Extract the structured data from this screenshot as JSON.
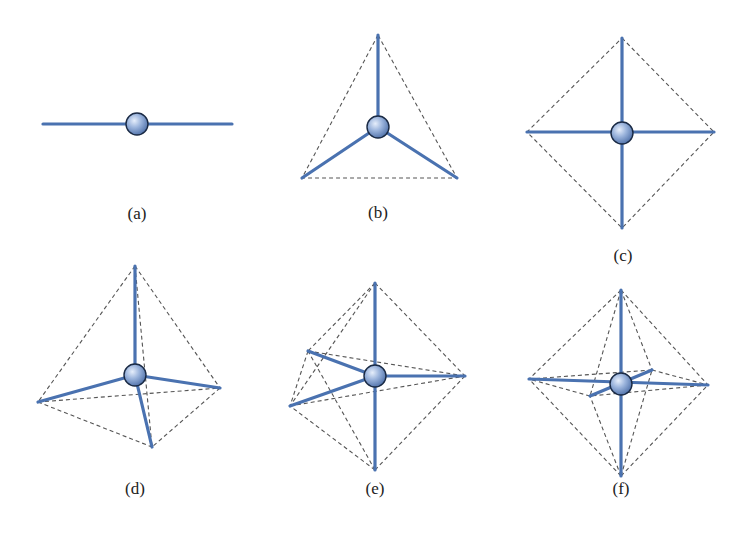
{
  "figure": {
    "colors": {
      "bond": "#4a72b0",
      "edge_dashed": "#555555",
      "atom_fill_light": "#c9d8ef",
      "atom_fill_dark": "#4d6fa8",
      "atom_outline": "#1a2a44",
      "label": "#222222"
    },
    "panels": [
      {
        "id": "a",
        "label": "(a)",
        "geometry": "linear",
        "bonds": 2
      },
      {
        "id": "b",
        "label": "(b)",
        "geometry": "trigonal planar",
        "bonds": 3
      },
      {
        "id": "c",
        "label": "(c)",
        "geometry": "square planar",
        "bonds": 4
      },
      {
        "id": "d",
        "label": "(d)",
        "geometry": "tetrahedral",
        "bonds": 4
      },
      {
        "id": "e",
        "label": "(e)",
        "geometry": "trigonal bipyramidal",
        "bonds": 5
      },
      {
        "id": "f",
        "label": "(f)",
        "geometry": "octahedral",
        "bonds": 6
      }
    ]
  }
}
